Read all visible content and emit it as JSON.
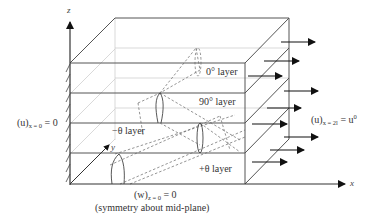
{
  "diagram": {
    "type": "laminate-plate-boundary-conditions",
    "axes": {
      "x": "x",
      "y": "y",
      "z": "z"
    },
    "layers": [
      {
        "name": "0° layer",
        "position": "top"
      },
      {
        "name": "90° layer",
        "position": "second"
      },
      {
        "name": "−θ layer",
        "position": "third"
      },
      {
        "name": "+θ layer",
        "position": "bottom"
      }
    ],
    "boundary_conditions": {
      "left": {
        "var": "(u)",
        "sub": "x = 0",
        "rhs": "= 0"
      },
      "right": {
        "var": "(u)",
        "sub": "x = 2l",
        "rhs": "= u",
        "rhs_sup": "0"
      },
      "bottom": {
        "var": "(w)",
        "sub": "z = 0",
        "rhs": "= 0",
        "note": "(symmetry about mid-plane)"
      }
    },
    "colors": {
      "line": "#555555",
      "dashed": "#777777",
      "arrow": "#111111",
      "light": "#bbbbbb"
    }
  }
}
